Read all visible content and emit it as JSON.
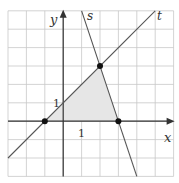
{
  "chart_data": {
    "type": "line",
    "title": "",
    "xlabel": "x",
    "ylabel": "y",
    "xlim": [
      -3,
      6
    ],
    "ylim": [
      -3,
      6
    ],
    "grid": true,
    "tick_labels": {
      "x_unit": "1",
      "y_unit": "1"
    },
    "series": [
      {
        "name": "t",
        "equation": "y = x + 1",
        "points": [
          [
            -3,
            -2
          ],
          [
            5,
            6
          ]
        ]
      },
      {
        "name": "s",
        "equation": "y = -3x + 9",
        "points": [
          [
            1,
            6
          ],
          [
            4,
            -3
          ]
        ]
      }
    ],
    "marked_points": [
      [
        -1,
        0
      ],
      [
        2,
        3
      ],
      [
        3,
        0
      ]
    ],
    "shaded_region": {
      "vertices": [
        [
          -1,
          0
        ],
        [
          0,
          1
        ],
        [
          2,
          3
        ],
        [
          3,
          0
        ]
      ],
      "color": "#e6e6e6"
    },
    "colors": {
      "grid": "#c8c8c8",
      "axis": "#333333",
      "line": "#555555",
      "point": "#111111"
    }
  },
  "labels": {
    "x": "x",
    "y": "y",
    "s": "s",
    "t": "t",
    "x_one": "1",
    "y_one": "1"
  }
}
